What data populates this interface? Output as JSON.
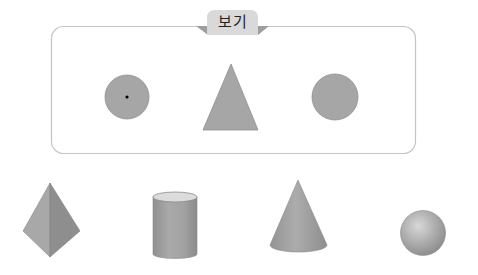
{
  "box": {
    "tab_label": "보기",
    "border_color": "#c4c4c4",
    "tab_color": "#d9d9d9",
    "tab_flap_color": "#9e9e9e",
    "shapes": [
      {
        "kind": "circle-with-center-dot",
        "cx": 127,
        "cy": 97,
        "r": 22,
        "fill": "#a6a6a6"
      },
      {
        "kind": "triangle",
        "points": "231,64 203,130 258,130",
        "fill": "#a6a6a6"
      },
      {
        "kind": "circle",
        "cx": 335,
        "cy": 97,
        "r": 23,
        "fill": "#a6a6a6"
      }
    ]
  },
  "solids": [
    {
      "kind": "pyramid"
    },
    {
      "kind": "cylinder"
    },
    {
      "kind": "cone"
    },
    {
      "kind": "sphere"
    }
  ]
}
